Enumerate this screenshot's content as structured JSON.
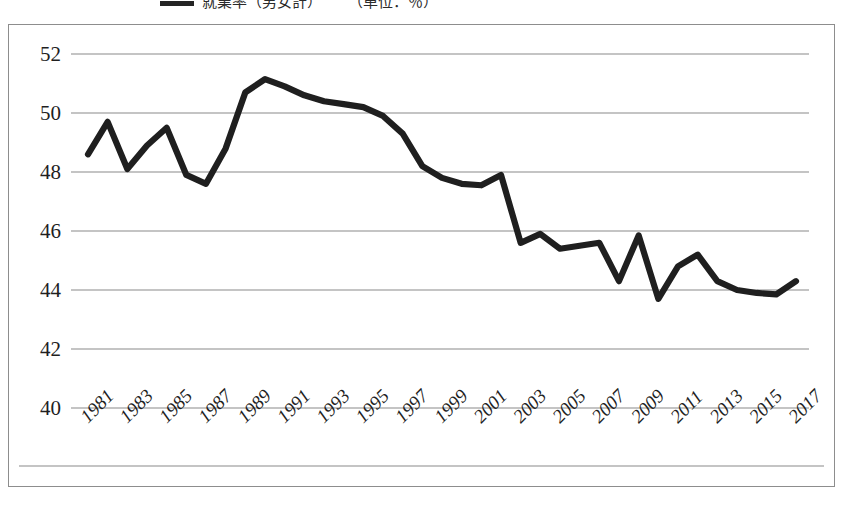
{
  "legend": {
    "series_label": "就業率（男女計）",
    "note_label": "（単位：％）",
    "swatch_color": "#242424"
  },
  "chart_frame": {
    "border_color": "#8d8d8d",
    "background": "#ffffff"
  },
  "chart_data": {
    "type": "line",
    "title": "",
    "subtitle": "",
    "xlabel": "",
    "ylabel": "",
    "ylim": [
      40,
      52
    ],
    "xlim": [
      1981,
      2017
    ],
    "grid": true,
    "legend_position": "top",
    "line_color": "#1f1f1f",
    "gridline_color": "#8a8a8a",
    "yticks": [
      40,
      42,
      44,
      46,
      48,
      50,
      52
    ],
    "ytick_labels": [
      "40",
      "42",
      "44",
      "46",
      "48",
      "50",
      "52"
    ],
    "xticks": [
      1981,
      1983,
      1985,
      1987,
      1989,
      1991,
      1993,
      1995,
      1997,
      1999,
      2001,
      2003,
      2005,
      2007,
      2009,
      2011,
      2013,
      2015,
      2017
    ],
    "xtick_labels": [
      "1981",
      "1983",
      "1985",
      "1987",
      "1989",
      "1991",
      "1993",
      "1995",
      "1997",
      "1999",
      "2001",
      "2003",
      "2005",
      "2007",
      "2009",
      "2011",
      "2013",
      "2015",
      "2017"
    ],
    "x": [
      1981,
      1982,
      1983,
      1984,
      1985,
      1986,
      1987,
      1988,
      1989,
      1990,
      1991,
      1992,
      1993,
      1994,
      1995,
      1996,
      1997,
      1998,
      1999,
      2000,
      2001,
      2002,
      2003,
      2004,
      2005,
      2006,
      2007,
      2008,
      2009,
      2010,
      2011,
      2012,
      2013,
      2014,
      2015,
      2016,
      2017
    ],
    "series": [
      {
        "name": "就業率（男女計）",
        "values": [
          48.6,
          49.7,
          48.1,
          48.9,
          49.5,
          47.9,
          47.6,
          48.8,
          50.7,
          51.15,
          50.9,
          50.6,
          50.4,
          50.3,
          50.2,
          49.9,
          49.3,
          48.2,
          47.8,
          47.6,
          47.55,
          47.9,
          45.6,
          45.9,
          45.4,
          45.5,
          45.6,
          44.3,
          45.85,
          43.7,
          44.8,
          45.2,
          44.3,
          44.0,
          43.9,
          43.85,
          44.3
        ]
      }
    ]
  }
}
